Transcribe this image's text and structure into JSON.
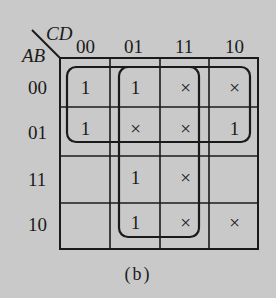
{
  "diagram": {
    "type": "karnaugh-map",
    "caption": "(b)",
    "row_variables": "AB",
    "col_variables": "CD",
    "col_headers": [
      "00",
      "01",
      "11",
      "10"
    ],
    "row_headers": [
      "00",
      "01",
      "11",
      "10"
    ],
    "cells": [
      [
        "1",
        "1",
        "×",
        "×"
      ],
      [
        "1",
        "×",
        "×",
        "1"
      ],
      [
        "",
        "1",
        "×",
        ""
      ],
      [
        "",
        "1",
        "×",
        "×"
      ]
    ],
    "groups": [
      {
        "name": "rows-00-01-all-columns",
        "rows": [
          "00",
          "01"
        ],
        "cols": [
          "00",
          "01",
          "11",
          "10"
        ]
      },
      {
        "name": "columns-01-11-all-rows",
        "rows": [
          "00",
          "01",
          "11",
          "10"
        ],
        "cols": [
          "01",
          "11"
        ]
      }
    ],
    "colors": {
      "background": "#c9c9c9",
      "ink": "#1a1a1a"
    }
  }
}
